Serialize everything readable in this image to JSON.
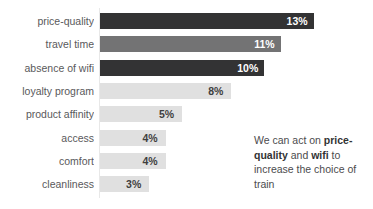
{
  "chart_data": {
    "type": "bar",
    "orientation": "horizontal",
    "title": "",
    "subtitle": "",
    "xlabel": "",
    "ylabel": "",
    "grid": false,
    "legend": "none",
    "xlim": [
      0,
      14
    ],
    "categories": [
      "price-quality",
      "travel time",
      "absence of wifi",
      "loyalty program",
      "product affinity",
      "access",
      "comfort",
      "cleanliness"
    ],
    "values": [
      13,
      11,
      10,
      8,
      5,
      4,
      4,
      3
    ],
    "value_labels": [
      "13%",
      "11%",
      "10%",
      "8%",
      "5%",
      "4%",
      "4%",
      "3%"
    ],
    "bar_colors": [
      "#333334",
      "#737374",
      "#333334",
      "#e0e0e0",
      "#e0e0e0",
      "#e0e0e0",
      "#e0e0e0",
      "#e0e0e0"
    ],
    "value_label_colors": [
      "#ffffff",
      "#ffffff",
      "#ffffff",
      "#3f3f3f",
      "#3f3f3f",
      "#3f3f3f",
      "#3f3f3f",
      "#3f3f3f"
    ],
    "annotation": {
      "segments": [
        {
          "text": "We can act on ",
          "bold": false
        },
        {
          "text": "price-quality",
          "bold": true
        },
        {
          "text": " and ",
          "bold": false
        },
        {
          "text": "wifi",
          "bold": true
        },
        {
          "text": " to increase the choice of train",
          "bold": false
        }
      ],
      "plain_text": "We can act on price-quality and wifi to increase the choice of train"
    }
  },
  "colors": {
    "background": "#ffffff",
    "axis_line": "#e8e8e8",
    "category_label": "#59595b",
    "annotation_text": "#4b4b4d",
    "annotation_bold": "#333334"
  }
}
